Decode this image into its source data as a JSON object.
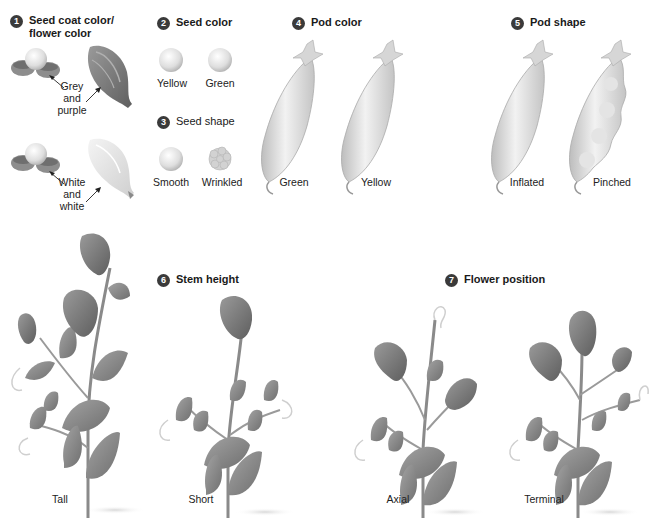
{
  "figure": {
    "characters": [
      {
        "number": "1",
        "title_line1": "Seed coat color/",
        "title_line2": "flower color",
        "variants": [
          {
            "label_lines": [
              "Grey",
              "and",
              "purple"
            ]
          },
          {
            "label_lines": [
              "White",
              "and",
              "white"
            ]
          }
        ]
      },
      {
        "number": "2",
        "title": "Seed color",
        "variants": [
          {
            "label": "Yellow"
          },
          {
            "label": "Green"
          }
        ]
      },
      {
        "number": "3",
        "title": "Seed shape",
        "variants": [
          {
            "label": "Smooth"
          },
          {
            "label": "Wrinkled"
          }
        ]
      },
      {
        "number": "4",
        "title": "Pod color",
        "variants": [
          {
            "label": "Green"
          },
          {
            "label": "Yellow"
          }
        ]
      },
      {
        "number": "5",
        "title": "Pod shape",
        "variants": [
          {
            "label": "Inflated"
          },
          {
            "label": "Pinched"
          }
        ]
      },
      {
        "number": "6",
        "title": "Stem height",
        "variants": [
          {
            "label": "Tall"
          },
          {
            "label": "Short"
          }
        ]
      },
      {
        "number": "7",
        "title": "Flower position",
        "variants": [
          {
            "label": "Axial"
          },
          {
            "label": "Terminal"
          }
        ]
      }
    ]
  },
  "colors": {
    "badge": "#3a3a3a",
    "leaf": "#8a8a8a",
    "seed": "#e6e6e6",
    "pod": "#dcdcdc"
  }
}
